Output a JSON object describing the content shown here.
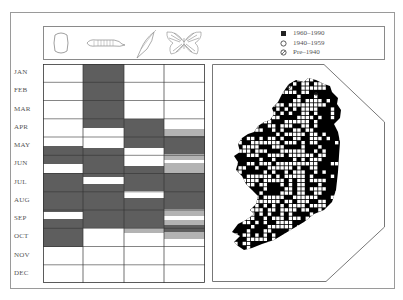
{
  "header": {
    "stages": [
      {
        "name": "egg",
        "icon": "egg-icon"
      },
      {
        "name": "larva",
        "icon": "caterpillar-icon"
      },
      {
        "name": "pupa",
        "icon": "chrysalis-icon"
      },
      {
        "name": "adult",
        "icon": "butterfly-icon"
      }
    ],
    "legend": [
      {
        "symbol": "filled-square",
        "label": "1960–1990"
      },
      {
        "symbol": "open-circle",
        "label": "1940–1959"
      },
      {
        "symbol": "slashed-circle",
        "label": "Pre–1940"
      }
    ]
  },
  "months": [
    "JAN",
    "FEB",
    "MAR",
    "APR",
    "MAY",
    "JUN",
    "JUL",
    "AUG",
    "SEP",
    "OCT",
    "NOV",
    "DEC"
  ],
  "colors": {
    "dark_band": "#5e5e5e",
    "light_band": "#b3b3b3",
    "map_land": "#000000",
    "map_record": "#ffffff",
    "frame": "#9a9a9a"
  },
  "chart_data": {
    "type": "heatmap",
    "xlabel": "Life stage",
    "ylabel": "Month",
    "categories": [
      "egg",
      "larva",
      "pupa",
      "adult"
    ],
    "y_categories": [
      "JAN",
      "FEB",
      "MAR",
      "APR",
      "MAY",
      "JUN",
      "JUL",
      "AUG",
      "SEP",
      "OCT",
      "NOV",
      "DEC"
    ],
    "note": "Bands given as [start_month, end_month] in fractional months (0 = start of JAN, 12 = end of DEC). 'dark' = main occurrence, 'light' = occasional/partial occurrence.",
    "series": [
      {
        "name": "egg",
        "bands": [
          {
            "from": 4.5,
            "to": 5.5,
            "shade": "dark"
          },
          {
            "from": 5.95,
            "to": 8.1,
            "shade": "dark"
          },
          {
            "from": 8.5,
            "to": 10.0,
            "shade": "dark"
          }
        ]
      },
      {
        "name": "larva",
        "bands": [
          {
            "from": 0.0,
            "to": 3.5,
            "shade": "dark"
          },
          {
            "from": 4.6,
            "to": 6.2,
            "shade": "dark"
          },
          {
            "from": 6.6,
            "to": 9.0,
            "shade": "dark"
          }
        ]
      },
      {
        "name": "pupa",
        "bands": [
          {
            "from": 3.0,
            "to": 4.6,
            "shade": "dark"
          },
          {
            "from": 5.6,
            "to": 6.95,
            "shade": "dark"
          },
          {
            "from": 7.35,
            "to": 9.0,
            "shade": "dark"
          },
          {
            "from": 9.0,
            "to": 9.25,
            "shade": "light"
          }
        ]
      },
      {
        "name": "adult",
        "bands": [
          {
            "from": 3.55,
            "to": 3.95,
            "shade": "light"
          },
          {
            "from": 3.95,
            "to": 4.95,
            "shade": "dark"
          },
          {
            "from": 4.95,
            "to": 5.25,
            "shade": "light"
          },
          {
            "from": 5.45,
            "to": 5.95,
            "shade": "light"
          },
          {
            "from": 5.95,
            "to": 7.95,
            "shade": "dark"
          },
          {
            "from": 7.95,
            "to": 8.35,
            "shade": "light"
          },
          {
            "from": 8.55,
            "to": 8.8,
            "shade": "light"
          },
          {
            "from": 8.8,
            "to": 9.2,
            "shade": "dark"
          },
          {
            "from": 9.2,
            "to": 9.6,
            "shade": "light"
          }
        ]
      }
    ],
    "map": {
      "region": "Ireland",
      "grid": "10 km squares",
      "legend": [
        "1960–1990 (filled square)",
        "1940–1959 (open circle)",
        "Pre–1940 (slashed circle)"
      ],
      "coverage": "Records widespread across most of the island; dense in all regions"
    },
    "grid": true,
    "legend_position": "top-right"
  }
}
